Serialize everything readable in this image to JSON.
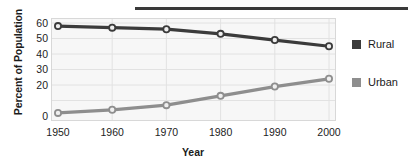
{
  "chart_data": {
    "type": "line",
    "title": "",
    "xlabel": "Year",
    "ylabel": "Percent of Population",
    "categories": [
      "1950",
      "1960",
      "1970",
      "1980",
      "1990",
      "2000"
    ],
    "x": [
      1950,
      1960,
      1970,
      1980,
      1990,
      2000
    ],
    "series": [
      {
        "name": "Rural",
        "color": "#3b3b3b",
        "values": [
          58,
          57,
          56,
          53,
          49,
          45
        ]
      },
      {
        "name": "Urban",
        "color": "#8e8e8e",
        "values": [
          2,
          4,
          7,
          13,
          19,
          24
        ]
      }
    ],
    "ylim": [
      0,
      60
    ],
    "yticks": [
      60,
      50,
      40,
      30,
      20,
      10,
      0
    ],
    "ytick_labels": [
      "60",
      "50",
      "40",
      "30",
      "20",
      "",
      "0"
    ],
    "grid": true,
    "legend_position": "right",
    "markers": "circle"
  },
  "axis": {
    "y_title": "Percent of Population",
    "x_title": "Year"
  },
  "legend": {
    "items": [
      {
        "label": "Rural",
        "color": "#3b3b3b"
      },
      {
        "label": "Urban",
        "color": "#8e8e8e"
      }
    ]
  },
  "colors": {
    "rural": "#3b3b3b",
    "urban": "#8e8e8e",
    "plot_background": "#f7f7f7",
    "gridline": "#e2e2e2",
    "plot_border": "#d8d8d8",
    "rule": "#3a3a3a",
    "text": "#1b1b1b"
  }
}
